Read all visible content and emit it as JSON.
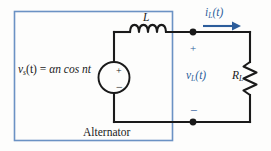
{
  "figure": {
    "enclosure_label": "Alternator",
    "colors": {
      "wire": "#1a1a1a",
      "enclosure_box": "#6b92c4",
      "annotation_blue": "#2c5d9b",
      "background": "#fdfdfc"
    }
  },
  "source": {
    "name": "voltage-source",
    "expression_lhs": "v",
    "expression_lhs_sub": "s",
    "expression_mid": "(t) = ",
    "expression_rhs": "αn  cos nt",
    "expression_full": "v_s(t) = αn cos nt",
    "terminal_plus": "+",
    "terminal_minus": "−"
  },
  "inductor": {
    "name": "inductor",
    "label": "L",
    "coil_count": 4
  },
  "resistor": {
    "name": "load-resistor",
    "label": "R",
    "label_sub": "L",
    "label_full": "R_L"
  },
  "current": {
    "name": "load-current",
    "label": "i",
    "label_sub": "L",
    "label_suffix": "(t)",
    "label_full": "i_L(t)",
    "direction": "right"
  },
  "voltage": {
    "name": "load-voltage",
    "label": "v",
    "label_sub": "L",
    "label_suffix": "(t)",
    "label_full": "v_L(t)",
    "polarity_plus": "+",
    "polarity_minus": "−"
  },
  "nodes": {
    "top_junction": "node-top",
    "bottom_junction": "node-bottom"
  }
}
